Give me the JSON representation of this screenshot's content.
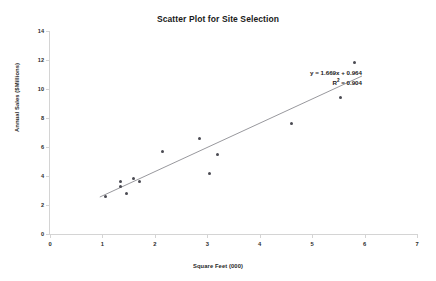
{
  "chart_data": {
    "type": "scatter",
    "title": "Scatter Plot for Site Selection",
    "xlabel": "Square Feet (000)",
    "ylabel": "Annual Sales ($Millions)",
    "xlim": [
      0,
      7
    ],
    "ylim": [
      0,
      14
    ],
    "xticks": [
      0,
      1,
      2,
      3,
      4,
      5,
      6,
      7
    ],
    "yticks": [
      0,
      2,
      4,
      6,
      8,
      10,
      12,
      14
    ],
    "xtick_labels": [
      "0",
      "1",
      "2",
      "3",
      "4",
      "5",
      "6",
      "7"
    ],
    "ytick_labels": [
      "0",
      "2",
      "4",
      "6",
      "8",
      "10",
      "12",
      "14"
    ],
    "grid": false,
    "legend": false,
    "legend_position": "none",
    "series": [
      {
        "name": "Sites",
        "marker": "diamond",
        "color": "#4a4a52",
        "points": [
          {
            "x": 1.05,
            "y": 2.6
          },
          {
            "x": 1.35,
            "y": 3.6
          },
          {
            "x": 1.35,
            "y": 3.3
          },
          {
            "x": 1.45,
            "y": 2.8
          },
          {
            "x": 1.6,
            "y": 3.8
          },
          {
            "x": 1.7,
            "y": 3.6
          },
          {
            "x": 2.15,
            "y": 5.7
          },
          {
            "x": 2.85,
            "y": 6.6
          },
          {
            "x": 3.05,
            "y": 4.2
          },
          {
            "x": 3.2,
            "y": 5.5
          },
          {
            "x": 4.6,
            "y": 7.6
          },
          {
            "x": 5.55,
            "y": 9.4
          },
          {
            "x": 5.8,
            "y": 11.8
          }
        ]
      }
    ],
    "trendline": {
      "type": "linear",
      "slope": 1.669,
      "intercept": 0.964,
      "r_squared": 0.904,
      "color": "#6b6b73",
      "x_start": 0.95,
      "x_end": 5.95
    },
    "annotations": {
      "equation": "y = 1.669x + 0.964",
      "r_squared_label_prefix": "R",
      "r_squared_label_suffix": " = 0.904",
      "r_squared_exponent": "2"
    }
  },
  "colors": {
    "marker": "#4a4a52",
    "trendline": "#6b6b73",
    "axis": "#d4d4d4",
    "text": "#1a1a1a",
    "background": "#ffffff"
  }
}
